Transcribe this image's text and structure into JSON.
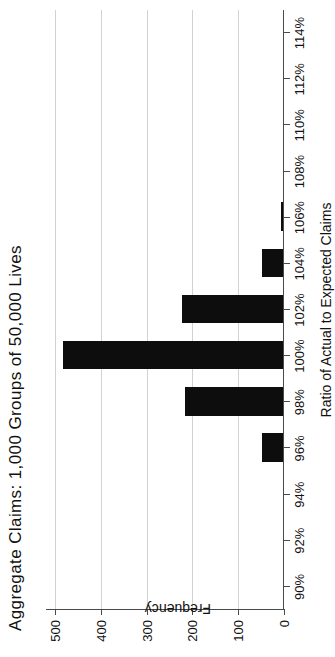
{
  "chart": {
    "title": "Aggregate Claims:  1,000 Groups of 50,000 Lives",
    "x_axis_title": "Ratio of Actual to Expected Claims",
    "y_axis_title": "Frequency"
  },
  "chart_data": {
    "type": "bar",
    "title": "Aggregate Claims:  1,000 Groups of 50,000 Lives",
    "xlabel": "Ratio of Actual to Expected Claims",
    "ylabel": "Frequency",
    "orientation": "vertical",
    "grid": "horizontal",
    "legend": "none",
    "rotation_deg": 90,
    "xlim": [
      "90%",
      "114%"
    ],
    "ylim": [
      0,
      520
    ],
    "categories": [
      "90%",
      "92%",
      "94%",
      "96%",
      "98%",
      "100%",
      "102%",
      "104%",
      "106%",
      "108%",
      "110%",
      "112%",
      "114%"
    ],
    "xticklabels": [
      "90%",
      "92%",
      "94%",
      "96%",
      "98%",
      "100%",
      "102%",
      "104%",
      "106%",
      "108%",
      "110%",
      "112%",
      "114%"
    ],
    "yticklabels": [
      "0",
      "100",
      "200",
      "300",
      "400",
      "500"
    ],
    "yticks": [
      0,
      100,
      200,
      300,
      400,
      500
    ],
    "values": [
      0,
      0,
      0,
      45,
      215,
      480,
      220,
      45,
      5,
      0,
      0,
      0,
      0
    ],
    "bars": [
      {
        "category": "90%",
        "value": 0
      },
      {
        "category": "92%",
        "value": 0
      },
      {
        "category": "94%",
        "value": 0
      },
      {
        "category": "96%",
        "value": 45
      },
      {
        "category": "98%",
        "value": 215
      },
      {
        "category": "100%",
        "value": 480
      },
      {
        "category": "102%",
        "value": 220
      },
      {
        "category": "104%",
        "value": 45
      },
      {
        "category": "106%",
        "value": 5
      },
      {
        "category": "108%",
        "value": 0
      },
      {
        "category": "110%",
        "value": 0
      },
      {
        "category": "112%",
        "value": 0
      },
      {
        "category": "114%",
        "value": 0
      }
    ],
    "colors": {
      "bar": "#0d0d0d",
      "grid": "#d2d2d2",
      "axis": "#4a4a4a",
      "text": "#111111",
      "background": "#ffffff"
    }
  }
}
